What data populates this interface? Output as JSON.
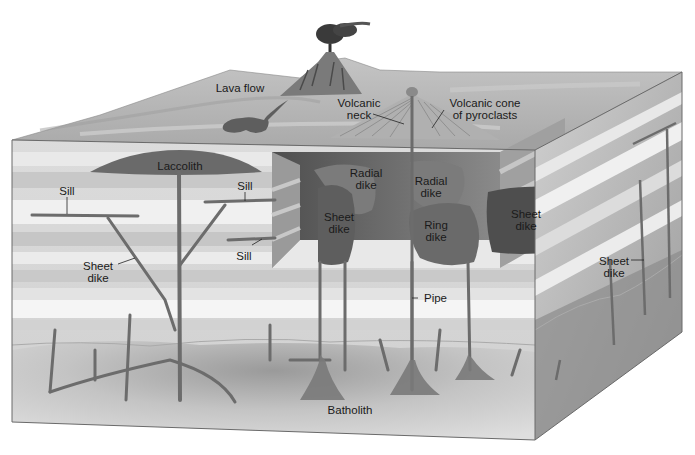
{
  "diagram": {
    "type": "block-diagram",
    "colors": {
      "surface": "#b8b8b8",
      "layer_light": "#e6e6e6",
      "layer_mid": "#cfcfcf",
      "layer_dark": "#bdbdbd",
      "magma": "#6e6e6e",
      "batholith": "#d2d2d2",
      "cutaway_shadow": "#5a5a5a"
    },
    "labels": {
      "lava_flow": "Lava flow",
      "volcanic_neck": "Volcanic\nneck",
      "volcanic_cone": "Volcanic cone\nof pyroclasts",
      "laccolith": "Laccolith",
      "sill_left": "Sill",
      "sill_upper_right": "Sill",
      "sill_lower_right": "Sill",
      "sheet_dike_left": "Sheet\ndike",
      "radial_dike_1": "Radial\ndike",
      "radial_dike_2": "Radial\ndike",
      "sheet_dike_center": "Sheet\ndike",
      "ring_dike": "Ring\ndike",
      "sheet_dike_right_inner": "Sheet\ndike",
      "sheet_dike_right_side": "Sheet\ndike",
      "pipe": "Pipe",
      "batholith": "Batholith"
    }
  }
}
